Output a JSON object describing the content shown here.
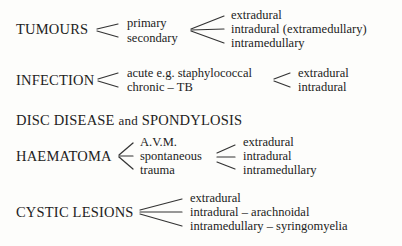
{
  "groups": {
    "tumours": {
      "title": "TUMOURS",
      "level1": [
        "primary",
        "secondary"
      ],
      "level2": [
        "extradural",
        "intradural (extramedullary)",
        "intramedullary"
      ]
    },
    "infection": {
      "title": "INFECTION",
      "level1": [
        "acute e.g. staphylococcal",
        "chronic – TB"
      ],
      "level2": [
        "extradural",
        "intradural"
      ]
    },
    "disc": {
      "title_part1": "DISC DISEASE",
      "title_and": "and",
      "title_part2": "SPONDYLOSIS"
    },
    "haematoma": {
      "title": "HAEMATOMA",
      "level1": [
        "A.V.M.",
        "spontaneous",
        "trauma"
      ],
      "level2": [
        "extradural",
        "intradural",
        "intramedullary"
      ]
    },
    "cystic": {
      "title": "CYSTIC LESIONS",
      "level1": [
        "extradural",
        "intradural – arachnoidal",
        "intramedullary – syringomyelia"
      ]
    }
  }
}
